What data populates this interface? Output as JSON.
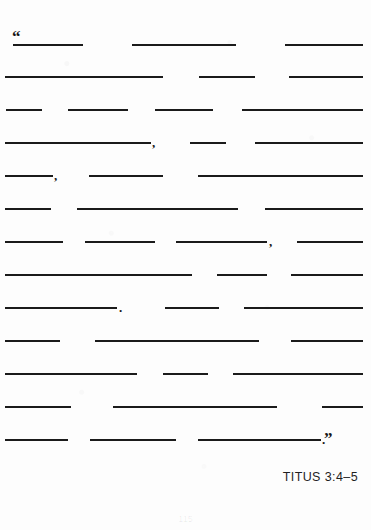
{
  "page": {
    "background_color": "#fdfdfd",
    "ink_color": "#1b1b1b",
    "width": 371,
    "height": 530
  },
  "passage": {
    "open_quote": "“",
    "close_quote": "”",
    "lines": [
      {
        "index": 1,
        "top": 30,
        "blanks": [
          {
            "left": 13,
            "width": 70
          },
          {
            "left": 132,
            "width": 104
          },
          {
            "left": 285,
            "width": 78
          }
        ],
        "punctuation": []
      },
      {
        "index": 2,
        "top": 62,
        "blanks": [
          {
            "left": 5,
            "width": 158
          },
          {
            "left": 199,
            "width": 56
          },
          {
            "left": 289,
            "width": 74
          }
        ],
        "punctuation": []
      },
      {
        "index": 3,
        "top": 95,
        "blanks": [
          {
            "left": 6,
            "width": 36
          },
          {
            "left": 68,
            "width": 60
          },
          {
            "left": 155,
            "width": 58
          },
          {
            "left": 242,
            "width": 121
          }
        ],
        "punctuation": []
      },
      {
        "index": 4,
        "top": 128,
        "blanks": [
          {
            "left": 5,
            "width": 146
          },
          {
            "left": 190,
            "width": 36
          },
          {
            "left": 255,
            "width": 108
          }
        ],
        "punctuation": [
          {
            "mark": ",",
            "left": 152
          }
        ]
      },
      {
        "index": 5,
        "top": 161,
        "blanks": [
          {
            "left": 5,
            "width": 48
          },
          {
            "left": 89,
            "width": 74
          },
          {
            "left": 198,
            "width": 165
          }
        ],
        "punctuation": [
          {
            "mark": ",",
            "left": 54
          }
        ]
      },
      {
        "index": 6,
        "top": 194,
        "blanks": [
          {
            "left": 5,
            "width": 46
          },
          {
            "left": 77,
            "width": 161
          },
          {
            "left": 265,
            "width": 98
          }
        ],
        "punctuation": []
      },
      {
        "index": 7,
        "top": 227,
        "blanks": [
          {
            "left": 5,
            "width": 58
          },
          {
            "left": 85,
            "width": 70
          },
          {
            "left": 176,
            "width": 91
          },
          {
            "left": 297,
            "width": 66
          }
        ],
        "punctuation": [
          {
            "mark": ",",
            "left": 269
          }
        ]
      },
      {
        "index": 8,
        "top": 260,
        "blanks": [
          {
            "left": 5,
            "width": 187
          },
          {
            "left": 217,
            "width": 50
          },
          {
            "left": 291,
            "width": 72
          }
        ],
        "punctuation": []
      },
      {
        "index": 9,
        "top": 293,
        "blanks": [
          {
            "left": 5,
            "width": 112
          },
          {
            "left": 165,
            "width": 54
          },
          {
            "left": 244,
            "width": 119
          }
        ],
        "punctuation": [
          {
            "mark": ".",
            "left": 119
          }
        ]
      },
      {
        "index": 10,
        "top": 326,
        "blanks": [
          {
            "left": 5,
            "width": 55
          },
          {
            "left": 95,
            "width": 164
          },
          {
            "left": 291,
            "width": 72
          }
        ],
        "punctuation": []
      },
      {
        "index": 11,
        "top": 359,
        "blanks": [
          {
            "left": 5,
            "width": 132
          },
          {
            "left": 163,
            "width": 45
          },
          {
            "left": 233,
            "width": 130
          }
        ],
        "punctuation": []
      },
      {
        "index": 12,
        "top": 392,
        "blanks": [
          {
            "left": 5,
            "width": 66
          },
          {
            "left": 113,
            "width": 164
          },
          {
            "left": 322,
            "width": 41
          }
        ],
        "punctuation": []
      },
      {
        "index": 13,
        "top": 425,
        "blanks": [
          {
            "left": 5,
            "width": 63
          },
          {
            "left": 90,
            "width": 86
          },
          {
            "left": 198,
            "width": 123
          }
        ],
        "punctuation": [
          {
            "mark": ".",
            "left": 322
          }
        ]
      }
    ]
  },
  "citation": {
    "text": "TITUS 3:4–5"
  },
  "footer": {
    "page_number": "115"
  }
}
